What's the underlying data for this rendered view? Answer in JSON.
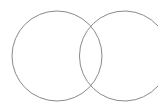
{
  "canvas": {
    "width": 161,
    "height": 112,
    "background": "#ffffff"
  },
  "stroke_color": "#8a8a8a",
  "shapes": {
    "left_circle": {
      "cx": 57,
      "cy": 56,
      "r": 45
    },
    "right_arc": {
      "cx": 124,
      "cy": 56,
      "r": 45,
      "start": [
        158,
        26
      ],
      "end": [
        158,
        86
      ]
    }
  }
}
